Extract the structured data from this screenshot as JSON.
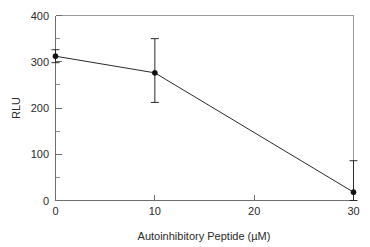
{
  "chart_data": {
    "type": "line",
    "title": "",
    "xlabel": "Autoinhibitory Peptide (µM)",
    "ylabel": "RLU",
    "x": [
      0,
      10,
      30
    ],
    "values": [
      312,
      276,
      18
    ],
    "errors_upper": [
      14,
      74,
      68
    ],
    "errors_lower": [
      14,
      64,
      18
    ],
    "xlim": [
      0,
      30
    ],
    "ylim": [
      0,
      400
    ],
    "xticks": [
      0,
      10,
      20,
      30
    ],
    "xtick_labels": [
      "0",
      "10",
      "20",
      "30"
    ],
    "yticks": [
      0,
      100,
      200,
      300,
      400
    ],
    "ytick_labels": [
      "0",
      "100",
      "200",
      "300",
      "400"
    ],
    "yminor_ticks": [
      50,
      150,
      250,
      350
    ],
    "grid": false,
    "legend": false,
    "marker": "filled-circle",
    "line_color": "#2a2a2a",
    "marker_color": "#111111",
    "axis_color": "#6e6e6e",
    "frame_color": "#9a9a9a",
    "background": "#ffffff"
  },
  "axes": {
    "x_title": "Autoinhibitory Peptide (µM)",
    "y_title": "RLU",
    "x_labels": {
      "t0": "0",
      "t1": "10",
      "t2": "20",
      "t3": "30"
    },
    "y_labels": {
      "t0": "0",
      "t1": "100",
      "t2": "200",
      "t3": "300",
      "t4": "400"
    }
  }
}
